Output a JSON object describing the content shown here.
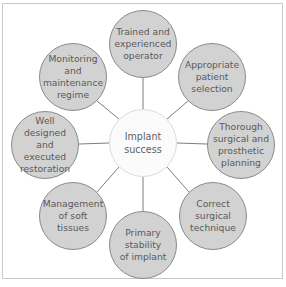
{
  "diagram": {
    "type": "hub-and-spoke",
    "center": {
      "label_lines": [
        "Implant",
        "success"
      ],
      "cx": 143,
      "cy": 143,
      "r": 34
    },
    "nodes": [
      {
        "id": "trained-operator",
        "label_lines": [
          "Trained and",
          "experienced",
          "operator"
        ],
        "cx": 143,
        "cy": 44,
        "r": 34
      },
      {
        "id": "patient-selection",
        "label_lines": [
          "Appropriate",
          "patient",
          "selection"
        ],
        "cx": 212,
        "cy": 77,
        "r": 34
      },
      {
        "id": "planning",
        "label_lines": [
          "Thorough",
          "surgical and",
          "prosthetic",
          "planning"
        ],
        "cx": 241,
        "cy": 145,
        "r": 34
      },
      {
        "id": "surgical-technique",
        "label_lines": [
          "Correct",
          "surgical",
          "technique"
        ],
        "cx": 213,
        "cy": 216,
        "r": 34
      },
      {
        "id": "primary-stability",
        "label_lines": [
          "Primary",
          "stability",
          "of implant"
        ],
        "cx": 143,
        "cy": 245,
        "r": 34
      },
      {
        "id": "soft-tissues",
        "label_lines": [
          "Management",
          "of soft tissues"
        ],
        "cx": 73,
        "cy": 216,
        "r": 34
      },
      {
        "id": "restoration",
        "label_lines": [
          "Well designed",
          "and executed",
          "restoration"
        ],
        "cx": 45,
        "cy": 145,
        "r": 34
      },
      {
        "id": "monitoring",
        "label_lines": [
          "Monitoring",
          "and",
          "maintenance",
          "regime"
        ],
        "cx": 73,
        "cy": 77,
        "r": 34
      }
    ],
    "colors": {
      "outer_fill": "#d2d2d2",
      "outer_stroke": "#8a8a8a",
      "center_fill": "#fbfbfb",
      "link": "#6e6e6e",
      "frame": "#c8c8c8",
      "text": "#5a5a5a"
    }
  }
}
